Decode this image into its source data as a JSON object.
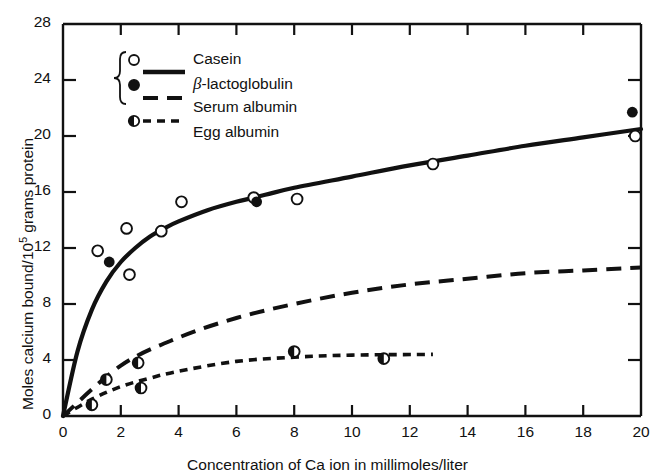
{
  "chart_data": {
    "type": "scatter",
    "title": "",
    "xlabel": "Concentration of Ca ion in millimoles/liter",
    "ylabel": "Moles calcium bound/10⁵ grams protein",
    "xlim": [
      0,
      20
    ],
    "ylim": [
      0,
      28
    ],
    "xticks": [
      0,
      2,
      4,
      6,
      8,
      10,
      12,
      14,
      16,
      18,
      20
    ],
    "yticks": [
      0,
      4,
      8,
      12,
      16,
      20,
      24,
      28
    ],
    "xtick_labels": [
      "0",
      "2",
      "4",
      "6",
      "8",
      "10",
      "12",
      "14",
      "16",
      "18",
      "20"
    ],
    "ytick_labels": [
      "0",
      "4",
      "8",
      "12",
      "16",
      "20",
      "24",
      "28"
    ],
    "grid": false,
    "legend_position": "upper-left-inside",
    "series": [
      {
        "name": "Casein",
        "marker": "open-circle",
        "line": "solid-shared",
        "points": [
          {
            "x": 1.2,
            "y": 11.8
          },
          {
            "x": 2.2,
            "y": 13.4
          },
          {
            "x": 2.3,
            "y": 10.1
          },
          {
            "x": 3.4,
            "y": 13.2
          },
          {
            "x": 4.1,
            "y": 15.3
          },
          {
            "x": 6.6,
            "y": 15.6
          },
          {
            "x": 8.1,
            "y": 15.5
          },
          {
            "x": 12.8,
            "y": 18.0
          },
          {
            "x": 19.8,
            "y": 20.0
          }
        ]
      },
      {
        "name": "β-lactoglobulin",
        "marker": "filled-circle",
        "line": "solid-shared",
        "points": [
          {
            "x": 1.6,
            "y": 11.0
          },
          {
            "x": 6.7,
            "y": 15.3
          },
          {
            "x": 19.7,
            "y": 21.7
          }
        ]
      },
      {
        "name": "Serum albumin",
        "marker": "none",
        "line": "long-dash",
        "points": [
          {
            "x": 0,
            "y": 0
          },
          {
            "x": 2,
            "y": 3.6
          },
          {
            "x": 4,
            "y": 5.6
          },
          {
            "x": 6,
            "y": 7.0
          },
          {
            "x": 8,
            "y": 8.0
          },
          {
            "x": 10,
            "y": 8.8
          },
          {
            "x": 12,
            "y": 9.4
          },
          {
            "x": 14,
            "y": 9.8
          },
          {
            "x": 16,
            "y": 10.2
          },
          {
            "x": 18,
            "y": 10.4
          },
          {
            "x": 20,
            "y": 10.6
          }
        ]
      },
      {
        "name": "Egg albumin",
        "marker": "half-filled-circle",
        "line": "short-dash",
        "points": [
          {
            "x": 1.0,
            "y": 0.8
          },
          {
            "x": 1.5,
            "y": 2.6
          },
          {
            "x": 2.6,
            "y": 3.8
          },
          {
            "x": 2.7,
            "y": 2.0
          },
          {
            "x": 8.0,
            "y": 4.6
          },
          {
            "x": 11.1,
            "y": 4.1
          }
        ],
        "line_points": [
          {
            "x": 0,
            "y": 0
          },
          {
            "x": 1,
            "y": 1.2
          },
          {
            "x": 2,
            "y": 2.1
          },
          {
            "x": 3,
            "y": 2.7
          },
          {
            "x": 4,
            "y": 3.2
          },
          {
            "x": 6,
            "y": 3.9
          },
          {
            "x": 8,
            "y": 4.2
          },
          {
            "x": 10,
            "y": 4.35
          },
          {
            "x": 12.8,
            "y": 4.4
          }
        ]
      },
      {
        "name": "Casein / β-lactoglobulin curve",
        "marker": "none",
        "line": "solid",
        "line_points": [
          {
            "x": 0,
            "y": 0
          },
          {
            "x": 0.5,
            "y": 4.6
          },
          {
            "x": 1.0,
            "y": 7.6
          },
          {
            "x": 1.5,
            "y": 9.6
          },
          {
            "x": 2.0,
            "y": 11.0
          },
          {
            "x": 2.5,
            "y": 12.0
          },
          {
            "x": 3.0,
            "y": 12.8
          },
          {
            "x": 3.5,
            "y": 13.4
          },
          {
            "x": 4.0,
            "y": 13.9
          },
          {
            "x": 5.0,
            "y": 14.7
          },
          {
            "x": 6.0,
            "y": 15.3
          },
          {
            "x": 7.0,
            "y": 15.8
          },
          {
            "x": 8.0,
            "y": 16.3
          },
          {
            "x": 10.0,
            "y": 17.1
          },
          {
            "x": 12.0,
            "y": 17.9
          },
          {
            "x": 14.0,
            "y": 18.6
          },
          {
            "x": 16.0,
            "y": 19.3
          },
          {
            "x": 18.0,
            "y": 19.9
          },
          {
            "x": 20.0,
            "y": 20.5
          }
        ]
      }
    ]
  },
  "axes": {
    "x_title": "Concentration of Ca ion in millimoles/liter",
    "y_title_prefix": "Moles calcium bound/10",
    "y_title_sup": "5",
    "y_title_suffix": " grams protein"
  },
  "legend": {
    "items": [
      {
        "label": "Casein",
        "marker": "open-circle"
      },
      {
        "label": "-lactoglobulin",
        "marker": "filled-circle",
        "prefix_symbol": "β"
      },
      {
        "label": "Serum albumin",
        "marker": "long-dash-line"
      },
      {
        "label": "Egg albumin",
        "marker": "half-filled-circle-short-dash"
      }
    ]
  },
  "colors": {
    "ink": "#111111",
    "background": "#ffffff"
  }
}
